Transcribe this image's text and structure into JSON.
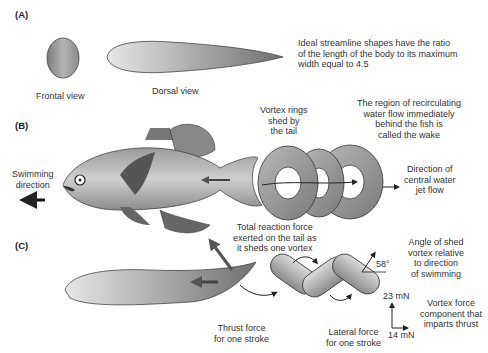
{
  "panels": {
    "a": {
      "label": "(A)",
      "frontal_view": "Frontal view",
      "dorsal_view": "Dorsal view",
      "note": [
        "Ideal streamline shapes have the ratio",
        "of the length of the body to its maximum",
        "width equal to 4.5"
      ]
    },
    "b": {
      "label": "(B)",
      "swimming_direction": [
        "Swimming",
        "direction"
      ],
      "vortex_rings": [
        "Vortex rings",
        "shed by",
        "the tail"
      ],
      "wake": [
        "The region of recirculating",
        "water flow immediately",
        "behind the fish is",
        "called the wake"
      ],
      "jet_flow": [
        "Direction of",
        "central water",
        "jet flow"
      ],
      "reaction_force": [
        "Total reaction force",
        "exerted on the tail as",
        "it sheds  one vortex"
      ]
    },
    "c": {
      "label": "(C)",
      "angle_value": "58°",
      "angle_note": [
        "Angle of shed",
        "vortex relative",
        "to direction",
        "of swimming"
      ],
      "thrust_force": [
        "Thrust force",
        "for one stroke"
      ],
      "lateral_force": [
        "Lateral force",
        "for one stroke"
      ],
      "force_vertical": "23 mN",
      "force_horizontal": "14 mN",
      "vortex_component": [
        "Vortex force",
        "component that",
        "imparts thrust"
      ]
    }
  },
  "colors": {
    "body_dark": "#6e6e6e",
    "body_light": "#c8c8c8",
    "arrow": "#555555",
    "outline": "#333333"
  }
}
